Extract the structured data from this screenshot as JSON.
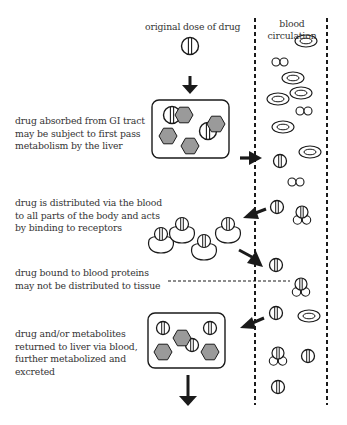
{
  "diagram": {
    "title_top": "original dose of drug",
    "column_header": [
      "blood",
      "circulation"
    ],
    "steps": [
      {
        "id": "absorption",
        "lines": [
          "drug absorbed from GI tract",
          "may be subject to first pass",
          "metabolism by the liver"
        ]
      },
      {
        "id": "distribution",
        "lines": [
          "drug is distributed via the blood",
          "to all parts of the body and acts",
          "by binding to receptors"
        ]
      },
      {
        "id": "protein-binding",
        "lines": [
          "drug bound to blood proteins",
          "may not be distributed to tissue"
        ]
      },
      {
        "id": "elimination",
        "lines": [
          "drug and/or metabolites",
          "returned to liver via blood,",
          "further metabolized and",
          "excreted"
        ]
      }
    ],
    "colors": {
      "line": "#1a1a1a",
      "hexagon_fill": "#9a9a9a",
      "text": "#333333",
      "background": "#ffffff"
    },
    "icons": {
      "drug": "pill-circle-with-stripe",
      "metabolite": "gray-hexagon",
      "red_cell": "double-ellipse",
      "platelet": "double-circle",
      "protein_bound_drug": "pill-on-three-circles",
      "receptor_bound_drug": "pill-on-receptor-blob"
    },
    "blood_column": {
      "left_x": 255,
      "right_x": 327,
      "red_cells": [
        [
          306,
          41
        ],
        [
          293,
          78
        ],
        [
          278,
          99
        ],
        [
          300,
          93
        ],
        [
          283,
          127
        ],
        [
          311,
          150
        ],
        [
          310,
          332
        ]
      ],
      "platelets": [
        [
          278,
          62
        ],
        [
          304,
          111
        ],
        [
          296,
          182
        ]
      ],
      "drugs": [
        [
          281,
          163
        ],
        [
          277,
          218
        ],
        [
          275,
          269
        ],
        [
          278,
          343
        ],
        [
          308,
          379
        ],
        [
          278,
          408
        ]
      ],
      "protein_bound": [
        [
          301,
          231
        ],
        [
          302,
          296
        ],
        [
          280,
          378
        ]
      ]
    }
  }
}
